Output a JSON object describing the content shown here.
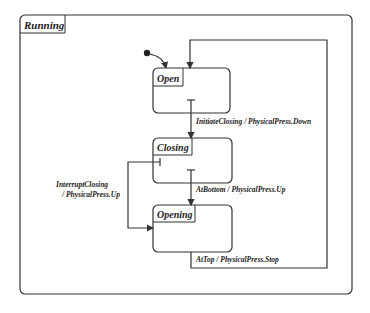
{
  "diagram": {
    "type": "statechart",
    "superstate": {
      "name": "Running"
    },
    "states": [
      {
        "name": "Open"
      },
      {
        "name": "Closing"
      },
      {
        "name": "Opening"
      }
    ],
    "transitions": [
      {
        "label": "InitiateClosing  / PhysicalPress.Down",
        "from": "Open",
        "to": "Closing"
      },
      {
        "label": "AtBottom / PhysicalPress.Up",
        "from": "Closing",
        "to": "Opening"
      },
      {
        "label_line1": "InterruptClosing",
        "label_line2": "/ PhysicalPress.Up",
        "from": "Closing",
        "to": "Opening"
      },
      {
        "label": "AtTop / PhysicalPress.Stop",
        "from": "Opening",
        "to": "Open"
      }
    ],
    "colors": {
      "stroke": "#333333",
      "background": "#ffffff"
    }
  }
}
